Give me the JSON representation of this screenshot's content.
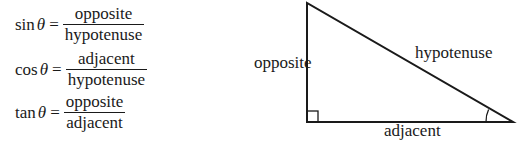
{
  "formulas": [
    {
      "fn": "sin",
      "theta": "θ",
      "eq": "=",
      "numerator": "opposite",
      "denominator": "hypotenuse"
    },
    {
      "fn": "cos",
      "theta": "θ",
      "eq": "=",
      "numerator": "adjacent",
      "denominator": "hypotenuse"
    },
    {
      "fn": "tan",
      "theta": "θ",
      "eq": "=",
      "numerator": "opposite",
      "denominator": "adjacent"
    }
  ],
  "triangle": {
    "labels": {
      "opposite": "opposite",
      "hypotenuse": "hypotenuse",
      "adjacent": "adjacent"
    },
    "stroke_color": "#1a1a1a"
  }
}
